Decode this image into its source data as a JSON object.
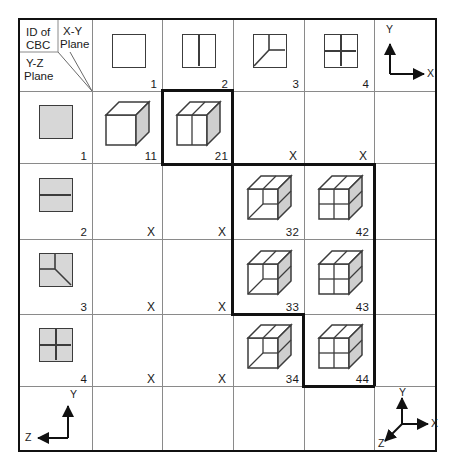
{
  "diagram": {
    "corner": {
      "id_label": "ID of\nCBC",
      "id_label_line1": "ID of",
      "id_label_line2": "CBC",
      "xy_label_line1": "X-Y",
      "xy_label_line2": "Plane",
      "yz_label_line1": "Y-Z",
      "yz_label_line2": "Plane"
    },
    "column_headers": [
      {
        "id": "1",
        "pattern": "plain"
      },
      {
        "id": "2",
        "pattern": "vertical-split"
      },
      {
        "id": "3",
        "pattern": "quarter-diagonal"
      },
      {
        "id": "4",
        "pattern": "four-quadrant"
      }
    ],
    "row_headers": [
      {
        "id": "1",
        "pattern": "plain"
      },
      {
        "id": "2",
        "pattern": "horizontal-split"
      },
      {
        "id": "3",
        "pattern": "quarter-diagonal"
      },
      {
        "id": "4",
        "pattern": "four-quadrant"
      }
    ],
    "cells": [
      {
        "row": "1",
        "col": "1",
        "value": "11",
        "type": "cube",
        "cube": "plain",
        "highlight": false
      },
      {
        "row": "1",
        "col": "2",
        "value": "21",
        "type": "cube",
        "cube": "vertical-split",
        "highlight": true
      },
      {
        "row": "1",
        "col": "3",
        "value": "X",
        "type": "invalid",
        "highlight": false
      },
      {
        "row": "1",
        "col": "4",
        "value": "X",
        "type": "invalid",
        "highlight": false
      },
      {
        "row": "2",
        "col": "1",
        "value": "X",
        "type": "invalid",
        "highlight": false
      },
      {
        "row": "2",
        "col": "2",
        "value": "X",
        "type": "invalid",
        "highlight": false
      },
      {
        "row": "2",
        "col": "3",
        "value": "32",
        "type": "cube",
        "cube": "quarter-diagonal",
        "highlight": true
      },
      {
        "row": "2",
        "col": "4",
        "value": "42",
        "type": "cube",
        "cube": "four-quadrant",
        "highlight": true
      },
      {
        "row": "3",
        "col": "1",
        "value": "X",
        "type": "invalid",
        "highlight": false
      },
      {
        "row": "3",
        "col": "2",
        "value": "X",
        "type": "invalid",
        "highlight": false
      },
      {
        "row": "3",
        "col": "3",
        "value": "33",
        "type": "cube",
        "cube": "quarter-diagonal",
        "highlight": true
      },
      {
        "row": "3",
        "col": "4",
        "value": "43",
        "type": "cube",
        "cube": "four-quadrant",
        "highlight": true
      },
      {
        "row": "4",
        "col": "1",
        "value": "X",
        "type": "invalid",
        "highlight": false
      },
      {
        "row": "4",
        "col": "2",
        "value": "X",
        "type": "invalid",
        "highlight": false
      },
      {
        "row": "4",
        "col": "3",
        "value": "34",
        "type": "cube",
        "cube": "quarter-diagonal",
        "highlight": false
      },
      {
        "row": "4",
        "col": "4",
        "value": "44",
        "type": "cube",
        "cube": "four-quadrant",
        "highlight": true
      }
    ],
    "axes": {
      "top_right": {
        "name": "xy-axes",
        "labels": {
          "vertical": "Y",
          "horizontal": "X"
        }
      },
      "bottom_left": {
        "name": "yz-axes",
        "labels": {
          "vertical": "Y",
          "horizontal": "Z"
        }
      },
      "bottom_right": {
        "name": "xyz-axes",
        "labels": {
          "vertical": "Y",
          "horizontal": "X",
          "depth": "Z"
        }
      }
    },
    "colors": {
      "border": "#111111",
      "gridline": "#8a8a8a",
      "glyph_stroke": "#3c3c3c",
      "fill_gray": "#d7d7d7",
      "cube_side": "#cfcfcf",
      "background": "#ffffff"
    }
  }
}
